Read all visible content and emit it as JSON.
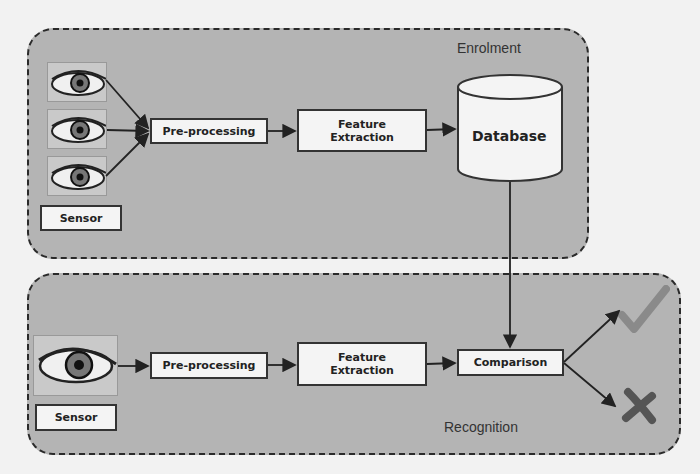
{
  "enrolment": {
    "title": "Enrolment",
    "sensor_label": "Sensor",
    "preprocessing_label": "Pre-processing",
    "feature_extraction_label": "Feature Extraction",
    "database_label": "Database"
  },
  "recognition": {
    "title": "Recognition",
    "sensor_label": "Sensor",
    "preprocessing_label": "Pre-processing",
    "feature_extraction_label": "Feature Extraction",
    "comparison_label": "Comparison",
    "outcomes": [
      {
        "name": "accept",
        "icon": "check-icon",
        "color": "#8a8a8a"
      },
      {
        "name": "reject",
        "icon": "cross-icon",
        "color": "#555555"
      }
    ]
  },
  "colors": {
    "region_fill": "#b4b4b4",
    "box_fill": "#f4f4f4",
    "stroke": "#2a2a2a"
  }
}
